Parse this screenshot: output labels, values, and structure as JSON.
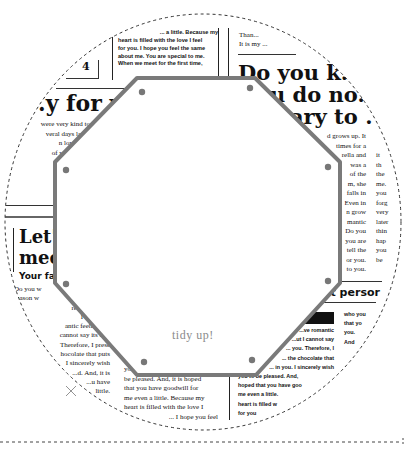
{
  "template": {
    "title": "tidy up!",
    "shape": "octagon",
    "outline_color": "#7a7a7a",
    "dot_color": "#777777",
    "cut_line": "dashed",
    "background_pattern": "newspaper"
  },
  "newspaper": {
    "top_center_block": [
      "... a little. Because my",
      "heart is filled with the love I feel",
      "for you. I hope you feel the same",
      "about me. You are special to me.",
      "When we meet for the first time,"
    ],
    "top_left_number": "4",
    "top_right_small": [
      "Than...",
      "It is my ..."
    ],
    "headline_right": [
      "Do you k...",
      "...u do no...",
      "...ary to ."
    ],
    "headline_left": ".y for yo",
    "left_paragraph": [
      "were very kind to",
      "veral days later,",
      "n love you.",
      "of your thing,",
      "py feelings,",
      "who you ar",
      "ews that y",
      "I want you t"
    ],
    "right_paragraph_a": [
      "d grows up. It",
      "times for a",
      "rella and",
      "was a",
      "of the",
      "m, she",
      "falls in",
      "Even in",
      "n grow",
      "mantic",
      "Do you",
      "you are",
      "tell the",
      "or you.",
      "to you."
    ],
    "right_paragraph_b": [
      "it",
      "th",
      "the",
      "me.",
      "you",
      "forg",
      "very",
      "later",
      "thin",
      "hap",
      "you",
      "be"
    ],
    "headline_mid_left": [
      "Let'",
      "mee"
    ],
    "subhead_left": "Your fa",
    "lower_left_paragraph": [
      "Do you w",
      "reason w",
      "resented the c",
      "I the truth.",
      "antic feelings fo",
      "cannot say its feel",
      "Therefore, I prese",
      "hocolate that puts",
      "I sincerely wish",
      "...d. And, it is",
      "...u have",
      "little."
    ],
    "headline_lower_right": "...t persor",
    "lower_right_paragraph": [
      "...ve romantic",
      "...ut I cannot say",
      "... you. Therefore, I",
      "... the chocolate that",
      "... in you. I sincerely wish",
      "you to be pleased. And,",
      "hoped that you have goo",
      "me even a little.",
      "heart is filled w",
      "for you"
    ],
    "lower_right_side": [
      "who you",
      "that yo",
      "you.",
      "And"
    ],
    "bottom_center_paragraph": [
      "you...",
      "be pleased. And, it is hoped",
      "that you have goodwill for",
      "me even a little. Because my",
      "heart is filled with the love I",
      "... I hope you feel"
    ]
  }
}
